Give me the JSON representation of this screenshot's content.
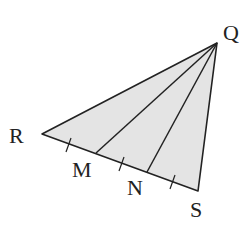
{
  "diagram": {
    "type": "triangle",
    "fill_color": "#e4e4e4",
    "stroke_color": "#222222",
    "points": {
      "Q": {
        "label": "Q",
        "x": 217,
        "y": 43
      },
      "R": {
        "label": "R",
        "x": 42,
        "y": 134
      },
      "M": {
        "label": "M",
        "x": 96,
        "y": 153
      },
      "N": {
        "label": "N",
        "x": 147,
        "y": 172
      },
      "S": {
        "label": "S",
        "x": 198,
        "y": 191
      }
    },
    "segments": [
      "QR",
      "QM",
      "QN",
      "QS",
      "RS"
    ],
    "congruence_ticks": [
      "RM",
      "MN",
      "NS"
    ]
  }
}
